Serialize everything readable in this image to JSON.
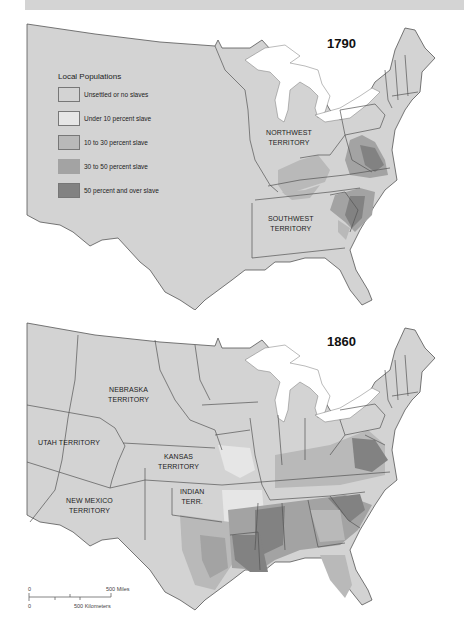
{
  "colors": {
    "unsettled": "#d3d3d3",
    "under10": "#e6e6e6",
    "p10to30": "#b9b9b9",
    "p30to50": "#a3a3a3",
    "p50plus": "#828282",
    "water": "#ffffff",
    "border": "#555555"
  },
  "legend": {
    "title": "Local Populations",
    "items": [
      {
        "label": "Unsettled or no slaves",
        "color": "#d3d3d3"
      },
      {
        "label": "Under 10 percent slave",
        "color": "#e6e6e6"
      },
      {
        "label": "10 to 30 percent slave",
        "color": "#b9b9b9"
      },
      {
        "label": "30 to 50 percent slave",
        "color": "#a3a3a3"
      },
      {
        "label": "50 percent and over slave",
        "color": "#828282"
      }
    ]
  },
  "map_1790": {
    "year": "1790",
    "labels": {
      "northwest": [
        "NORTHWEST",
        "TERRITORY"
      ],
      "southwest": [
        "SOUTHWEST",
        "TERRITORY"
      ]
    }
  },
  "map_1860": {
    "year": "1860",
    "labels": {
      "nebraska": [
        "NEBRASKA",
        "TERRITORY"
      ],
      "utah": [
        "UTAH TERRITORY"
      ],
      "kansas": [
        "KANSAS",
        "TERRITORY"
      ],
      "new_mexico": [
        "NEW MEXICO",
        "TERRITORY"
      ],
      "indian": [
        "INDIAN",
        "TERR."
      ]
    }
  },
  "scale_bar": {
    "miles_zero": "0",
    "miles_label": "500 Miles",
    "km_zero": "0",
    "km_label": "500 Kilometers"
  }
}
